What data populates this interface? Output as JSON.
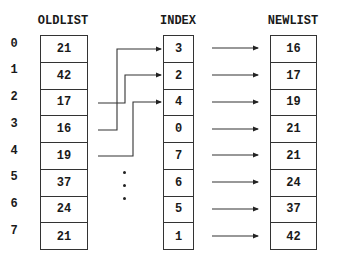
{
  "headers": {
    "oldlist": "OLDLIST",
    "index": "INDEX",
    "newlist": "NEWLIST"
  },
  "row_labels": [
    "0",
    "1",
    "2",
    "3",
    "4",
    "5",
    "6",
    "7"
  ],
  "oldlist": [
    "21",
    "42",
    "17",
    "16",
    "19",
    "37",
    "24",
    "21"
  ],
  "index": [
    "3",
    "2",
    "4",
    "0",
    "7",
    "6",
    "5",
    "1"
  ],
  "newlist": [
    "16",
    "17",
    "19",
    "21",
    "21",
    "24",
    "37",
    "42"
  ],
  "connectors": [
    {
      "from_oldlist_row": 3,
      "to_index_row": 0
    },
    {
      "from_oldlist_row": 2,
      "to_index_row": 1
    },
    {
      "from_oldlist_row": 4,
      "to_index_row": 2
    }
  ],
  "ellipsis": "vertical dots (continuation)",
  "colors": {
    "line": "#333333",
    "text": "#1a1a1a",
    "background": "#ffffff"
  }
}
